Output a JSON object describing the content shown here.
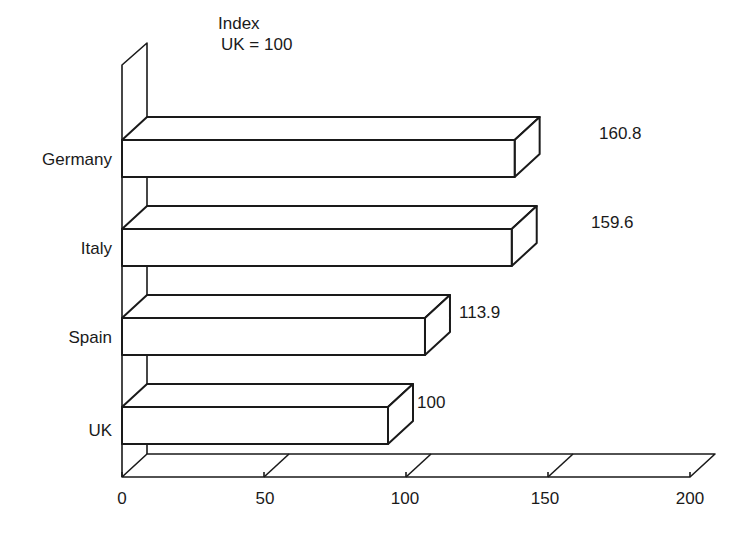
{
  "chart_data": {
    "type": "bar",
    "orientation": "horizontal",
    "style": "3d-outline",
    "title": "Index\nUK = 100",
    "title_lines": [
      "Index",
      "UK = 100"
    ],
    "categories": [
      "Germany",
      "Italy",
      "Spain",
      "UK"
    ],
    "values": [
      160.8,
      159.6,
      113.9,
      100
    ],
    "value_labels": [
      "160.8",
      "159.6",
      "113.9",
      "100"
    ],
    "xlabel": "",
    "ylabel": "",
    "xlim": [
      0,
      200
    ],
    "xticks": [
      0,
      50,
      100,
      150,
      200
    ],
    "xtick_labels": [
      "0",
      "50",
      "100",
      "150",
      "200"
    ],
    "grid": false,
    "legend": null
  },
  "colors": {
    "stroke": "#1a1a1a",
    "fill": "#ffffff",
    "background": "#ffffff"
  }
}
